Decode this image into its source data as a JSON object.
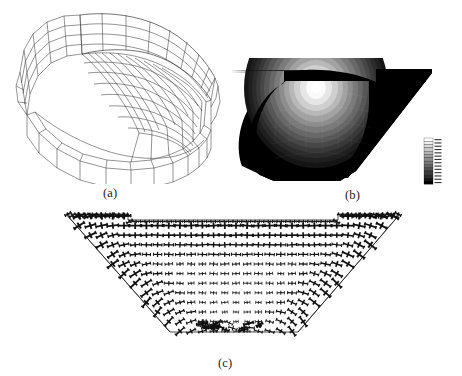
{
  "figure": {
    "panels": [
      {
        "id": "a",
        "caption": "(a)",
        "kind": "wireframe-mesh",
        "description": "Three-dimensional finite element wireframe mesh of a curved trough shaped shell segment"
      },
      {
        "id": "b",
        "caption": "(b)",
        "kind": "contour-fringe-plot",
        "description": "Grayscale contour fringe plot on the bowl shaped cross section with a stepped grayscale legend at the right"
      },
      {
        "id": "c",
        "caption": "(c)",
        "kind": "principal-stress-cross-plot",
        "description": "Principal stress tensor cross glyphs distributed over the bowl shaped cross section"
      }
    ]
  },
  "legend": {
    "title": "",
    "orientation": "vertical",
    "swatch_count": 14,
    "labels": [
      "",
      "",
      "",
      "",
      "",
      "",
      "",
      "",
      "",
      "",
      "",
      "",
      "",
      ""
    ],
    "colors": [
      "#ffffff",
      "#efefef",
      "#dcdcdc",
      "#c8c8c8",
      "#b4b4b4",
      "#a0a0a0",
      "#8c8c8c",
      "#787878",
      "#646464",
      "#505050",
      "#3c3c3c",
      "#282828",
      "#141414",
      "#000000"
    ]
  },
  "chart_data": {
    "type": "heatmap",
    "title": "",
    "xlabel": "",
    "ylabel": "",
    "legend_position": "right",
    "grid": false,
    "bands": 14,
    "band_colors": [
      "#ffffff",
      "#efefef",
      "#dcdcdc",
      "#c8c8c8",
      "#b4b4b4",
      "#a0a0a0",
      "#8c8c8c",
      "#787878",
      "#646464",
      "#505050",
      "#3c3c3c",
      "#282828",
      "#141414",
      "#000000"
    ],
    "series": [
      {
        "name": "panel-b-contour-levels",
        "values": [
          1,
          0.93,
          0.86,
          0.79,
          0.72,
          0.64,
          0.57,
          0.5,
          0.43,
          0.36,
          0.29,
          0.21,
          0.14,
          0.07
        ]
      }
    ],
    "annotation": "Peak value at the upper centre of the bowl, decaying radially outward to the dark outer flanges"
  },
  "colors": {
    "background": "#ffffff",
    "line": "#3a3a3a",
    "ink": "#1a1a1a",
    "dark": "#000000",
    "light": "#ffffff"
  }
}
